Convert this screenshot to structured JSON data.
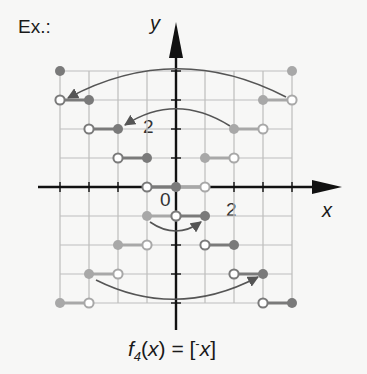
{
  "header": {
    "example_label": "Ex.:"
  },
  "axes": {
    "x_label": "x",
    "y_label": "y",
    "origin_label": "0",
    "x_tick_label": "2",
    "y_tick_label": "2"
  },
  "formula": {
    "text": "f4(x) = [-x]",
    "function_name": "f",
    "subscript": "4",
    "arg": "(x) = [",
    "neg": "-",
    "var": "x",
    "close": "]"
  },
  "colors": {
    "light_series": "#a8a8a8",
    "dark_series": "#7a7a7a",
    "grid": "#bdbdbd",
    "axis": "#111111",
    "arrow": "#555555"
  },
  "chart_data": {
    "type": "step",
    "title": "f4(x) = [-x]",
    "xlabel": "x",
    "ylabel": "y",
    "xlim": [
      -4,
      4
    ],
    "ylim": [
      -4,
      4
    ],
    "grid": true,
    "series": [
      {
        "name": "[x] (light gray, closed left / open right)",
        "segments": [
          {
            "y": 4,
            "x_closed": 4,
            "x_open": null
          },
          {
            "y": 3,
            "x_closed": 3,
            "x_open": 4
          },
          {
            "y": 2,
            "x_closed": 2,
            "x_open": 3
          },
          {
            "y": 1,
            "x_closed": 1,
            "x_open": 2
          },
          {
            "y": 0,
            "x_closed": 0,
            "x_open": 1
          },
          {
            "y": -1,
            "x_closed": -1,
            "x_open": 0
          },
          {
            "y": -2,
            "x_closed": -2,
            "x_open": -1
          },
          {
            "y": -3,
            "x_closed": -3,
            "x_open": -2
          },
          {
            "y": -4,
            "x_closed": -4,
            "x_open": -3
          }
        ]
      },
      {
        "name": "f4(x) = [-x] (dark gray, open left / closed right)",
        "segments": [
          {
            "y": 4,
            "x_open": null,
            "x_closed": -4
          },
          {
            "y": 3,
            "x_open": -4,
            "x_closed": -3
          },
          {
            "y": 2,
            "x_open": -3,
            "x_closed": -2
          },
          {
            "y": 1,
            "x_open": -2,
            "x_closed": -1
          },
          {
            "y": 0,
            "x_open": -1,
            "x_closed": 0
          },
          {
            "y": -1,
            "x_open": 0,
            "x_closed": 1
          },
          {
            "y": -2,
            "x_open": 1,
            "x_closed": 2
          },
          {
            "y": -3,
            "x_open": 2,
            "x_closed": 3
          },
          {
            "y": -4,
            "x_open": 3,
            "x_closed": 4
          }
        ]
      }
    ],
    "annotations": [
      "reflection arrows mirror [x] across the y-axis to give [-x]"
    ]
  }
}
